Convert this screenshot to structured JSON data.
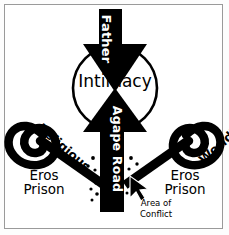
{
  "figure": {
    "title_text": "Agape Road",
    "border_color": "#9a9a9a",
    "background_color": "#ffffff",
    "ink_color": "#000000",
    "labels": {
      "father": "Father",
      "intimacy": "Intimacy",
      "religious": "Religious",
      "worldly": "Worldly",
      "agape_road": "Agape Road",
      "eros_prison_left_line1": "Eros",
      "eros_prison_left_line2": "Prison",
      "eros_prison_right_line1": "Eros",
      "eros_prison_right_line2": "Prison",
      "area_of_conflict_line1": "Area of",
      "area_of_conflict_line2": "Conflict"
    },
    "icons": {
      "father_arrow": "down-arrow-icon",
      "agape_arrow": "up-arrow-icon",
      "intimacy_node": "circle-node-icon",
      "left_spiral": "spiral-icon",
      "right_spiral": "spiral-icon-mirrored",
      "cursor": "mouse-cursor-icon",
      "conflict_dots": "dotted-texture-icon"
    }
  }
}
